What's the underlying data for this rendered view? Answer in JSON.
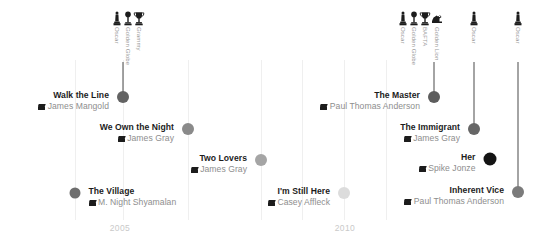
{
  "chart_data": {
    "type": "scatter",
    "title": "",
    "xlabel": "",
    "ylabel": "",
    "xlim": [
      2003.4,
      2015.4
    ],
    "ylim": [
      0,
      5
    ],
    "grid": true,
    "legend_position": "none",
    "x_ticks": [
      "2005",
      "2010"
    ],
    "categories": [
      "The Village",
      "Walk the Line",
      "We Own the Night",
      "Two Lovers",
      "I'm Still Here",
      "The Master",
      "The Immigrant",
      "Her",
      "Inherent Vice"
    ],
    "series": [
      {
        "name": "Films",
        "points": [
          {
            "label": "The Village",
            "director": "M. Night Shyamalan",
            "x": 2004.6,
            "y": 1.0,
            "size": 11,
            "shade": "#6e6e6e",
            "awards": 0
          },
          {
            "label": "Walk the Line",
            "director": "James Mangold",
            "x": 2005.8,
            "y": 3.3,
            "size": 12,
            "shade": "#636363",
            "awards": 3
          },
          {
            "label": "We Own the Night",
            "director": "James Gray",
            "x": 2007.4,
            "y": 2.5,
            "size": 12,
            "shade": "#8a8a8a",
            "awards": 0
          },
          {
            "label": "Two Lovers",
            "director": "James Gray",
            "x": 2008.6,
            "y": 1.75,
            "size": 12,
            "shade": "#a5a5a5",
            "awards": 0
          },
          {
            "label": "I'm Still Here",
            "director": "Casey Affleck",
            "x": 2010.3,
            "y": 0.85,
            "size": 12,
            "shade": "#dcdcdc",
            "awards": 0
          },
          {
            "label": "The Master",
            "director": "Paul Thomas Anderson",
            "x": 2012.3,
            "y": 3.3,
            "size": 12,
            "shade": "#5d5d5d",
            "awards": 4
          },
          {
            "label": "The Immigrant",
            "director": "James Gray",
            "x": 2013.2,
            "y": 2.55,
            "size": 12,
            "shade": "#666666",
            "awards": 1
          },
          {
            "label": "Her",
            "director": "Spike Jonze",
            "x": 2013.6,
            "y": 1.8,
            "size": 13,
            "shade": "#141414",
            "awards": 0
          },
          {
            "label": "Inherent Vice",
            "director": "Paul Thomas Anderson",
            "x": 2014.8,
            "y": 0.9,
            "size": 12,
            "shade": "#7b7b7b",
            "awards": 1
          }
        ]
      }
    ]
  },
  "films": [
    {
      "title": "The Village",
      "director": "M. Night Shyamalan",
      "side": "right",
      "dot_x": 75,
      "dot_y": 193,
      "dot_size": 11,
      "dot_color": "#6e6e6e",
      "label_y": 186,
      "stem_top": null,
      "icon": "clapperboard-icon"
    },
    {
      "title": "Walk the Line",
      "director": "James Mangold",
      "side": "left",
      "dot_x": 123,
      "dot_y": 97,
      "dot_size": 12,
      "dot_color": "#636363",
      "label_y": 90,
      "stem_top": 62,
      "icon": "clapperboard-icon"
    },
    {
      "title": "We Own the Night",
      "director": "James Gray",
      "side": "left",
      "dot_x": 188,
      "dot_y": 129,
      "dot_size": 12,
      "dot_color": "#8a8a8a",
      "label_y": 122,
      "stem_top": null,
      "icon": "clapperboard-icon"
    },
    {
      "title": "Two Lovers",
      "director": "James Gray",
      "side": "left",
      "dot_x": 261,
      "dot_y": 160,
      "dot_size": 12,
      "dot_color": "#a5a5a5",
      "label_y": 153,
      "stem_top": null,
      "icon": "clapperboard-icon"
    },
    {
      "title": "I'm Still Here",
      "director": "Casey Affleck",
      "side": "left",
      "dot_x": 344,
      "dot_y": 193,
      "dot_size": 12,
      "dot_color": "#dcdcdc",
      "label_y": 186,
      "stem_top": null,
      "icon": "clapperboard-icon"
    },
    {
      "title": "The Master",
      "director": "Paul Thomas Anderson",
      "side": "left",
      "dot_x": 434,
      "dot_y": 97,
      "dot_size": 12,
      "dot_color": "#5d5d5d",
      "label_y": 90,
      "stem_top": 62,
      "icon": "clapperboard-icon"
    },
    {
      "title": "The Immigrant",
      "director": "James Gray",
      "side": "left",
      "dot_x": 474,
      "dot_y": 129,
      "dot_size": 12,
      "dot_color": "#666666",
      "label_y": 122,
      "stem_top": 62,
      "icon": "clapperboard-icon"
    },
    {
      "title": "Her",
      "director": "Spike Jonze",
      "side": "left",
      "dot_x": 490,
      "dot_y": 159,
      "dot_size": 13,
      "dot_color": "#141414",
      "label_y": 152,
      "stem_top": null,
      "icon": "clapperboard-icon"
    },
    {
      "title": "Inherent Vice",
      "director": "Paul Thomas Anderson",
      "side": "left",
      "dot_x": 518,
      "dot_y": 192,
      "dot_size": 12,
      "dot_color": "#7b7b7b",
      "label_y": 185,
      "stem_top": 62,
      "icon": "clapperboard-icon"
    }
  ],
  "awards": [
    {
      "label": "Oscar",
      "x": 117,
      "y": 11,
      "glyph": "oscar-statuette-icon"
    },
    {
      "label": "Golden Globe",
      "x": 128,
      "y": 11,
      "glyph": "golden-globe-icon"
    },
    {
      "label": "Grammy",
      "x": 139,
      "y": 11,
      "glyph": "grammy-trophy-icon"
    },
    {
      "label": "Oscar",
      "x": 403,
      "y": 11,
      "glyph": "oscar-statuette-icon"
    },
    {
      "label": "Golden Globe",
      "x": 414,
      "y": 11,
      "glyph": "golden-globe-icon"
    },
    {
      "label": "BAFTA",
      "x": 425,
      "y": 11,
      "glyph": "bafta-trophy-icon"
    },
    {
      "label": "Golden Lion",
      "x": 437,
      "y": 11,
      "glyph": "golden-lion-icon"
    },
    {
      "label": "Oscar",
      "x": 474,
      "y": 11,
      "glyph": "oscar-statuette-icon"
    },
    {
      "label": "Oscar",
      "x": 518,
      "y": 11,
      "glyph": "oscar-statuette-icon"
    }
  ],
  "gridlines": [
    {
      "x": 75,
      "top": 60,
      "height": 160
    },
    {
      "x": 123,
      "top": 60,
      "height": 160
    },
    {
      "x": 188,
      "top": 60,
      "height": 160
    },
    {
      "x": 261,
      "top": 60,
      "height": 160
    },
    {
      "x": 302,
      "top": 60,
      "height": 160
    },
    {
      "x": 344,
      "top": 60,
      "height": 160
    },
    {
      "x": 386,
      "top": 60,
      "height": 160
    }
  ],
  "year_ticks": [
    {
      "label": "2005",
      "x": 120,
      "y": 223
    },
    {
      "label": "2010",
      "x": 345,
      "y": 223
    }
  ]
}
